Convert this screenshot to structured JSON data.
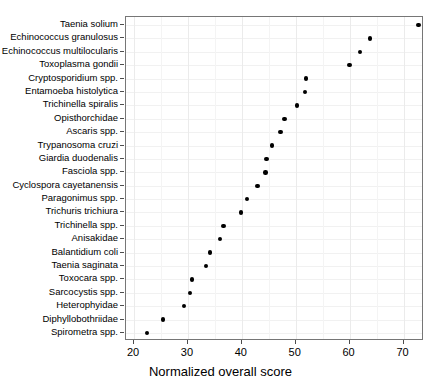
{
  "chart_data": {
    "type": "scatter",
    "title": "",
    "xlabel": "Normalized overall score",
    "ylabel": "",
    "xlim": [
      18.5,
      73.8
    ],
    "xticks": [
      20,
      30,
      40,
      50,
      60,
      70
    ],
    "xticklabels": [
      "20",
      "30",
      "40",
      "50",
      "60",
      "70"
    ],
    "grid": true,
    "legend": null,
    "orientation": "horizontal-dotplot",
    "categories": [
      "Taenia solium",
      "Echinococcus granulosus",
      "Echinococcus multilocularis",
      "Toxoplasma gondii",
      "Cryptosporidium spp.",
      "Entamoeba histolytica",
      "Trichinella spiralis",
      "Opisthorchidae",
      "Ascaris spp.",
      "Trypanosoma cruzi",
      "Giardia duodenalis",
      "Fasciola spp.",
      "Cyclospora cayetanensis",
      "Paragonimus spp.",
      "Trichuris trichiura",
      "Trichinella spp.",
      "Anisakidae",
      "Balantidium coli",
      "Taenia saginata",
      "Toxocara spp.",
      "Sarcocystis spp.",
      "Heterophyidae",
      "Diphyllobothriidae",
      "Spirometra spp."
    ],
    "values": [
      72.8,
      63.8,
      61.9,
      60.0,
      51.9,
      51.7,
      50.2,
      47.9,
      47.2,
      45.6,
      44.6,
      44.4,
      42.9,
      40.9,
      39.8,
      36.6,
      35.9,
      34.1,
      33.3,
      30.7,
      30.4,
      29.3,
      25.4,
      22.4
    ]
  }
}
